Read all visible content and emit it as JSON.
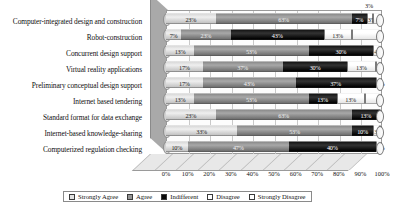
{
  "chart_data": {
    "type": "bar",
    "subtype": "stacked-horizontal-3d",
    "title": "",
    "xlabel": "",
    "ylabel": "",
    "xlim": [
      0,
      100
    ],
    "xticks": [
      "0%",
      "10%",
      "20%",
      "30%",
      "40%",
      "50%",
      "60%",
      "70%",
      "80%",
      "90%",
      "100%"
    ],
    "grid": true,
    "legend_position": "bottom",
    "stack_order": "Strongly Agree, Agree, Indifferent, Disagree, Strongly Disagree",
    "categories": [
      "Computer-integrated design and construction",
      "Robot-construction",
      "Concurrent design support",
      "Virtual reality applications",
      "Preliminary conceptual design support",
      "Internet based tendering",
      "Standard format for data exchange",
      "Internet-based knowledge-sharing",
      "Computerized regulation checking"
    ],
    "series": [
      {
        "name": "Strongly Agree",
        "color": "#e2e2e2",
        "values": [
          23,
          7,
          13,
          17,
          17,
          13,
          23,
          33,
          10
        ],
        "labels": [
          "23%",
          "7%",
          "13%",
          "17%",
          "17%",
          "13%",
          "23%",
          "33%",
          "10%"
        ]
      },
      {
        "name": "Agree",
        "color": "#949494",
        "values": [
          63,
          23,
          53,
          37,
          43,
          53,
          63,
          53,
          47
        ],
        "labels": [
          "63%",
          "23%",
          "53%",
          "37%",
          "43%",
          "53%",
          "63%",
          "53%",
          "47%"
        ]
      },
      {
        "name": "Indifferent",
        "color": "#0a0a0a",
        "values": [
          7,
          43,
          30,
          30,
          37,
          13,
          13,
          10,
          40
        ],
        "labels": [
          "7%",
          "43%",
          "30%",
          "30%",
          "37%",
          "13%",
          "13%",
          "10%",
          "40%"
        ]
      },
      {
        "name": "Disagree",
        "color": "#ffffff",
        "values": [
          3,
          13,
          4,
          13,
          3,
          13,
          1,
          3,
          3
        ],
        "labels": [
          "3%",
          "13%",
          "4%",
          "13%",
          "3%",
          "13%",
          "",
          "3%",
          "3%"
        ]
      },
      {
        "name": "Strongly Disagree",
        "color": "#ffffff",
        "values": [
          4,
          14,
          0,
          3,
          0,
          8,
          0,
          1,
          0
        ],
        "labels": [
          "",
          "",
          "",
          "",
          "",
          "",
          "",
          "",
          ""
        ]
      }
    ]
  },
  "legend": {
    "items": [
      {
        "label": "Strongly Agree"
      },
      {
        "label": "Agree"
      },
      {
        "label": "Indifferent"
      },
      {
        "label": "Disagree"
      },
      {
        "label": "Strongly Disagree"
      }
    ]
  }
}
